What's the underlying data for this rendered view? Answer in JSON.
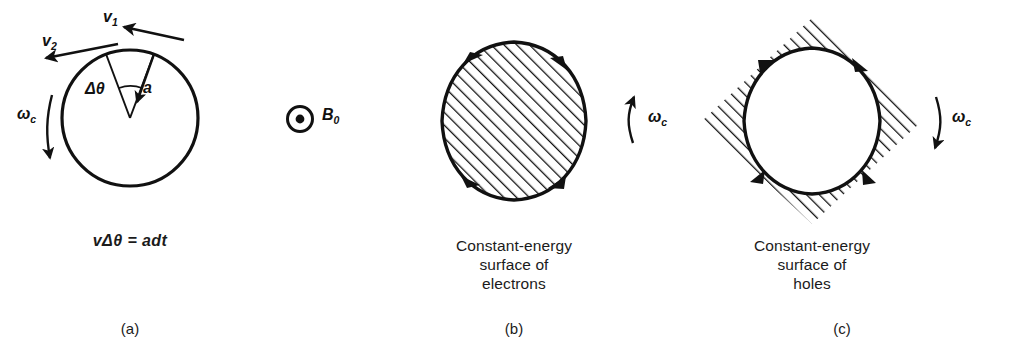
{
  "figure": {
    "background": "#ffffff",
    "ink": "#111111"
  },
  "panel_a": {
    "label": "(a)",
    "equation": "vΔθ = adt",
    "velocity_1": "v",
    "velocity_1_sub": "1",
    "velocity_2": "v",
    "velocity_2_sub": "2",
    "acceleration": "a",
    "delta_theta": "Δθ",
    "omega": "ω",
    "omega_sub": "c",
    "rotation_sense": "counterclockwise"
  },
  "field": {
    "symbol": "B",
    "symbol_sub": "0",
    "icon": "dot-in-circle-icon",
    "meaning": "field out of page"
  },
  "panel_b": {
    "label": "(b)",
    "caption": "Constant-energy\nsurface of\nelectrons",
    "omega": "ω",
    "omega_sub": "c",
    "rotation_sense": "counterclockwise",
    "fill": "hatched-inside",
    "arrow_count": 4
  },
  "panel_c": {
    "label": "(c)",
    "caption": "Constant-energy\nsurface of\nholes",
    "omega": "ω",
    "omega_sub": "c",
    "rotation_sense": "clockwise",
    "fill": "hatched-outside",
    "arrow_count": 4
  }
}
